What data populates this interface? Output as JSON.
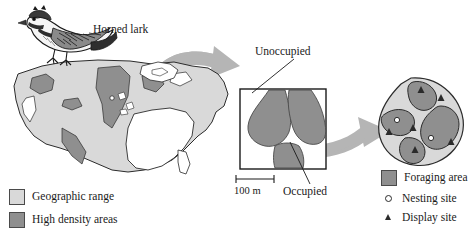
{
  "figure": {
    "species_label": "Horned lark",
    "background": "#ffffff"
  },
  "colors": {
    "geographic_range": "#d9d9d9",
    "high_density": "#8f8f8f",
    "foraging_area": "#8f8f8f",
    "territory_ground": "#d9d9d9",
    "outline": "#2b2b2b",
    "arrow": "#b5b5b5",
    "panel_border": "#1a1a1a",
    "text": "#1a1a1a"
  },
  "panels": {
    "continental": {
      "name": "us-range-map",
      "description": "Map of the contiguous United States shaded for horned lark geographic range with darker high density areas"
    },
    "landscape": {
      "name": "landscape-plot",
      "labels": {
        "unoccupied": "Unoccupied",
        "occupied": "Occupied"
      },
      "scale_bar": "100 m"
    },
    "territory": {
      "name": "territory-map",
      "nesting_site_count": 2,
      "display_site_count": 6
    }
  },
  "legend_left": {
    "items": [
      {
        "label": "Geographic range",
        "swatch": "#d9d9d9",
        "icon": "square-swatch"
      },
      {
        "label": "High density areas",
        "swatch": "#8f8f8f",
        "icon": "square-swatch"
      }
    ]
  },
  "legend_right": {
    "items": [
      {
        "label": "Foraging area",
        "swatch": "#8f8f8f",
        "icon": "square-swatch"
      },
      {
        "label": "Nesting site",
        "icon": "open-circle-marker"
      },
      {
        "label": "Display site",
        "icon": "filled-triangle-marker"
      }
    ]
  },
  "arrows": [
    {
      "name": "arrow-range-to-landscape",
      "from": "continental",
      "to": "landscape"
    },
    {
      "name": "arrow-landscape-to-territory",
      "from": "landscape",
      "to": "territory"
    }
  ]
}
